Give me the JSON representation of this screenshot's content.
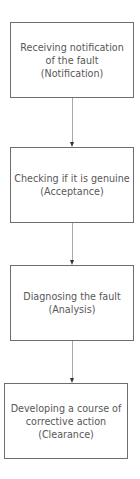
{
  "diagram": {
    "type": "flowchart",
    "direction": "top-to-bottom",
    "nodes": [
      {
        "id": "notification",
        "lines": [
          "Receiving notification",
          "of the fault",
          "(Notification)"
        ]
      },
      {
        "id": "acceptance",
        "lines": [
          "Checking if it is genuine",
          "(Acceptance)"
        ]
      },
      {
        "id": "analysis",
        "lines": [
          "Diagnosing the fault",
          "(Analysis)"
        ]
      },
      {
        "id": "clearance",
        "lines": [
          "Developing a course of",
          "corrective action",
          "(Clearance)"
        ]
      }
    ],
    "edges": [
      {
        "from": "notification",
        "to": "acceptance"
      },
      {
        "from": "acceptance",
        "to": "analysis"
      },
      {
        "from": "analysis",
        "to": "clearance"
      }
    ],
    "colors": {
      "box_border": "#6e6e6e",
      "text": "#585858",
      "connector": "#a8a8a8",
      "arrowhead": "#333333",
      "background": "#ffffff"
    }
  }
}
